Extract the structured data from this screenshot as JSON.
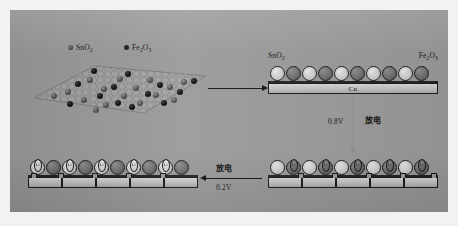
{
  "figure": {
    "background_color": "#ffffff",
    "panel_color": "#9a9a9a"
  },
  "legend": {
    "items": [
      {
        "label": "SnO",
        "sub": "2",
        "marker": "gray-dot",
        "color": "#6d6d6d"
      },
      {
        "label": "Fe",
        "sub": "2",
        "label2": "O",
        "sub2": "3",
        "marker": "black-dot",
        "color": "#1b1b1b"
      }
    ],
    "sno2_text": "SnO",
    "sno2_sub": "2",
    "fe2o3_text": "Fe",
    "fe2o3_sub1": "2",
    "fe2o3_mid": "O",
    "fe2o3_sub2": "3"
  },
  "nanosheet": {
    "name": "graphene-nanosheet",
    "shape": "rhombus",
    "lattice": "honeycomb",
    "sno2_particles": 16,
    "fe2o3_particles": 13
  },
  "stage_pristine": {
    "name": "pristine-electrode",
    "left_label_text": "SnO",
    "left_label_sub": "2",
    "right_label_text": "Fe",
    "right_label_sub1": "2",
    "right_label_mid": "O",
    "right_label_sub2": "3",
    "collector_label": "Cu",
    "particle_count": 10,
    "particle_sequence": [
      "sn",
      "fe",
      "sn",
      "fe",
      "sn",
      "fe",
      "sn",
      "fe",
      "sn",
      "fe"
    ]
  },
  "stage_discharged_08": {
    "name": "discharged-electrode-0-8v",
    "particle_count": 10,
    "particle_sequence": [
      "sn",
      "fe",
      "sn",
      "fe",
      "sn",
      "fe",
      "sn",
      "fe",
      "sn",
      "fe"
    ],
    "li_marker_label": "Li",
    "li_marker_count": 5,
    "li_marker_on": "fe2o3"
  },
  "stage_discharged_02": {
    "name": "discharged-electrode-0-2v",
    "particle_count": 10,
    "particle_sequence": [
      "sn",
      "fe",
      "sn",
      "fe",
      "sn",
      "fe",
      "sn",
      "fe",
      "sn",
      "fe"
    ],
    "li_marker_label": "Li",
    "li_marker_count": 5,
    "li_marker_on": "sno2"
  },
  "arrows": {
    "synthesis": {
      "name": "synthesis-arrow",
      "direction": "right",
      "label": ""
    },
    "first_discharge": {
      "name": "first-discharge-arrow",
      "direction": "down",
      "voltage": "0.8V",
      "process": "放电"
    },
    "second_discharge": {
      "name": "second-discharge-arrow",
      "direction": "left",
      "process": "放电",
      "voltage": "0.2V"
    }
  }
}
